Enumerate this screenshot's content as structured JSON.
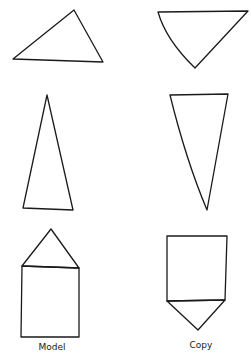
{
  "columns": {
    "model": {
      "label": "Model"
    },
    "copy": {
      "label": "Copy"
    }
  },
  "figures": [
    {
      "row": 1,
      "column": "model",
      "shape": "triangle",
      "description": "scalene triangle, apex up-right"
    },
    {
      "row": 1,
      "column": "copy",
      "shape": "triangle",
      "description": "inverted triangle with curved left side"
    },
    {
      "row": 2,
      "column": "model",
      "shape": "triangle",
      "description": "tall narrow triangle, apex up"
    },
    {
      "row": 2,
      "column": "copy",
      "shape": "triangle",
      "description": "tall narrow inverted triangle, apex down"
    },
    {
      "row": 3,
      "column": "model",
      "shape": "house",
      "description": "square with triangle on top"
    },
    {
      "row": 3,
      "column": "copy",
      "shape": "inverted-house",
      "description": "square with triangle below"
    }
  ],
  "colors": {
    "stroke": "#1a1a1a",
    "background": "#ffffff"
  }
}
